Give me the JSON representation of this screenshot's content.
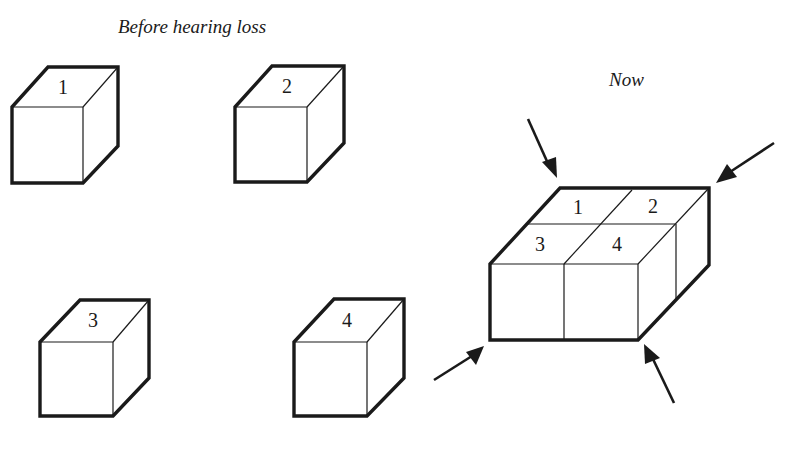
{
  "diagram": {
    "before_caption": "Before hearing loss",
    "now_caption": "Now",
    "separate_cubes": [
      {
        "label": "1"
      },
      {
        "label": "2"
      },
      {
        "label": "3"
      },
      {
        "label": "4"
      }
    ],
    "merged_block": {
      "cells": [
        {
          "label": "1"
        },
        {
          "label": "2"
        },
        {
          "label": "3"
        },
        {
          "label": "4"
        }
      ]
    },
    "arrows": [
      {
        "name": "arrow-top-left",
        "direction": "down-right"
      },
      {
        "name": "arrow-top-right",
        "direction": "down-left"
      },
      {
        "name": "arrow-bottom-left",
        "direction": "up-right"
      },
      {
        "name": "arrow-bottom-right",
        "direction": "up-left"
      }
    ],
    "colors": {
      "ink": "#1a1a1a",
      "background": "#ffffff"
    }
  }
}
